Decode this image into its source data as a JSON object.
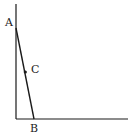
{
  "diagram": {
    "points": {
      "A": {
        "label": "A",
        "x": 16,
        "y": 28
      },
      "B": {
        "label": "B",
        "x": 34,
        "y": 119
      },
      "C": {
        "label": "C",
        "x": 25,
        "y": 72
      }
    },
    "axes": {
      "vertical": {
        "x": 16,
        "y1": 4,
        "y2": 119
      },
      "horizontal": {
        "y": 119,
        "x1": 16,
        "x2": 128
      }
    },
    "line_color": "#1a1a1a"
  }
}
